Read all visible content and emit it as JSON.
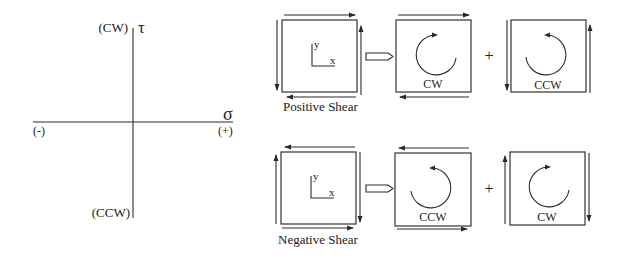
{
  "axes": {
    "tau_symbol": "τ",
    "sigma_symbol": "σ",
    "tau_positive_label": "(CW)",
    "tau_negative_label": "(CCW)",
    "sigma_negative_label": "(-)",
    "sigma_positive_label": "(+)"
  },
  "positive_shear": {
    "caption": "Positive Shear",
    "element": {
      "y_label": "y",
      "x_label": "x"
    },
    "equals_arrow": "hollow-right-arrow",
    "component_1": {
      "rotation_label": "CW",
      "shear_pair": "horizontal"
    },
    "plus": "+",
    "component_2": {
      "rotation_label": "CCW",
      "shear_pair": "vertical"
    }
  },
  "negative_shear": {
    "caption": "Negative Shear",
    "element": {
      "y_label": "y",
      "x_label": "x"
    },
    "equals_arrow": "hollow-right-arrow",
    "component_1": {
      "rotation_label": "CCW",
      "shear_pair": "horizontal"
    },
    "plus": "+",
    "component_2": {
      "rotation_label": "CW",
      "shear_pair": "vertical"
    }
  },
  "colors": {
    "line": "#2a2a2a",
    "background": "#ffffff"
  }
}
